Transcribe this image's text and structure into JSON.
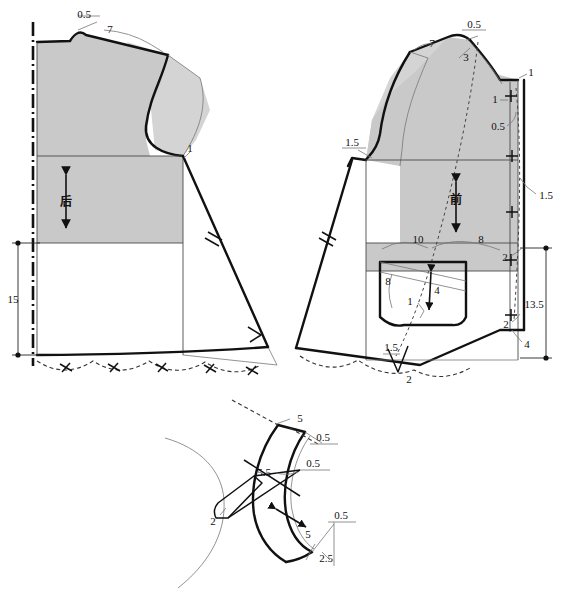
{
  "meta": {
    "caption": ""
  },
  "colors": {
    "fill_grey": "#c9c9c9",
    "fill_grey_light": "#d4d4d4",
    "line_dark": "#111111",
    "line_thin": "#555555",
    "background": "#ffffff"
  },
  "back_piece": {
    "name_label": "后",
    "measurements": [
      {
        "id": "back-shoulder-rise",
        "value": "0.5",
        "x": 84,
        "y": 18,
        "underline": true
      },
      {
        "id": "back-shoulder-width",
        "value": "7",
        "x": 110,
        "y": 30,
        "underline": false
      },
      {
        "id": "back-armhole-drop",
        "value": "1",
        "x": 186,
        "y": 152,
        "underline": false
      },
      {
        "id": "back-hem-length",
        "value": "15",
        "x": 18,
        "y": 303,
        "underline": false
      }
    ]
  },
  "front_piece": {
    "name_label": "前",
    "measurements": [
      {
        "id": "front-shoulder-rise",
        "value": "0.5",
        "x": 465,
        "y": 36,
        "underline": true
      },
      {
        "id": "front-shoulder-width",
        "value": "7",
        "x": 438,
        "y": 47,
        "underline": false
      },
      {
        "id": "front-neck-depth",
        "value": "3",
        "x": 463,
        "y": 58,
        "underline": false
      },
      {
        "id": "front-placket-top",
        "value": "1",
        "x": 524,
        "y": 79,
        "underline": false
      },
      {
        "id": "front-placket-button1",
        "value": "1",
        "x": 508,
        "y": 99,
        "underline": false
      },
      {
        "id": "front-placket-width",
        "value": "0.5",
        "x": 500,
        "y": 127,
        "underline": false
      },
      {
        "id": "front-placket-edge",
        "value": "1.5",
        "x": 540,
        "y": 196,
        "underline": false
      },
      {
        "id": "front-side-notch",
        "value": "1.5",
        "x": 350,
        "y": 154,
        "underline": false
      },
      {
        "id": "front-pocket-top-left",
        "value": "10",
        "x": 418,
        "y": 239,
        "underline": false
      },
      {
        "id": "front-pocket-top-right",
        "value": "8",
        "x": 481,
        "y": 240,
        "underline": false
      },
      {
        "id": "front-pocket-side",
        "value": "8",
        "x": 388,
        "y": 280,
        "underline": false
      },
      {
        "id": "front-pocket-depth",
        "value": "4",
        "x": 437,
        "y": 288,
        "underline": false
      },
      {
        "id": "front-pocket-corner",
        "value": "1",
        "x": 410,
        "y": 302,
        "underline": false
      },
      {
        "id": "front-hem-step-upper",
        "value": "2",
        "x": 507,
        "y": 260,
        "underline": false
      },
      {
        "id": "front-hem-step-lower",
        "value": "2",
        "x": 508,
        "y": 325,
        "underline": false
      },
      {
        "id": "front-hem-offset",
        "value": "4",
        "x": 524,
        "y": 345,
        "underline": false
      },
      {
        "id": "front-hem-height",
        "value": "13.5",
        "x": 534,
        "y": 305,
        "underline": false
      },
      {
        "id": "front-dart-height",
        "value": "1.5",
        "x": 393,
        "y": 348,
        "underline": true
      },
      {
        "id": "front-dart-width",
        "value": "2",
        "x": 409,
        "y": 378,
        "underline": false
      }
    ]
  },
  "collar_piece": {
    "measurements": [
      {
        "id": "collar-top-length",
        "value": "5",
        "x": 298,
        "y": 419,
        "underline": false
      },
      {
        "id": "collar-top-rise",
        "value": "0.5",
        "x": 313,
        "y": 440,
        "underline": false
      },
      {
        "id": "collar-mid-rise",
        "value": "0.5",
        "x": 303,
        "y": 464,
        "underline": false
      },
      {
        "id": "collar-band-length",
        "value": "5.5",
        "x": 262,
        "y": 472,
        "underline": false
      },
      {
        "id": "collar-neck-point",
        "value": "2",
        "x": 214,
        "y": 520,
        "underline": false
      },
      {
        "id": "collar-bottom-rise",
        "value": "0.5",
        "x": 337,
        "y": 516,
        "underline": false
      },
      {
        "id": "collar-bottom-length",
        "value": "5",
        "x": 310,
        "y": 535,
        "underline": false
      },
      {
        "id": "collar-bottom-drop",
        "value": "2.5",
        "x": 325,
        "y": 558,
        "underline": false
      }
    ]
  }
}
